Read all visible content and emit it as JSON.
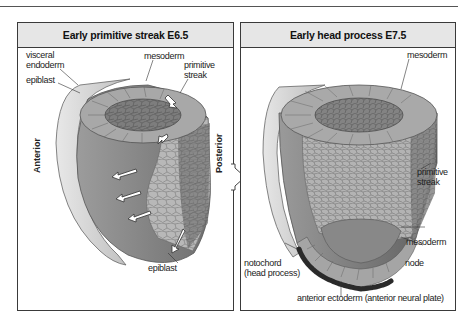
{
  "figure": {
    "panels": [
      {
        "title": "Early primitive streak E6.5",
        "labels": {
          "visceral_endoderm": "visceral\nendoderm",
          "visceral_endoderm_line1": "visceral",
          "visceral_endoderm_line2": "endoderm",
          "epiblast_top": "epiblast",
          "mesoderm": "mesoderm",
          "primitive_streak_line1": "primitive",
          "primitive_streak_line2": "streak",
          "anterior": "Anterior",
          "posterior": "Posterior",
          "epiblast_bottom": "epiblast"
        }
      },
      {
        "title": "Early head process E7.5",
        "labels": {
          "mesoderm_top": "mesoderm",
          "primitive_streak_line1": "primitive",
          "primitive_streak_line2": "streak",
          "mesoderm_bottom": "mesoderm",
          "node": "node",
          "notochord_line1": "notochord",
          "notochord_line2": "(head process)",
          "anterior_ectoderm": "anterior ectoderm (anterior neural plate)"
        }
      }
    ],
    "transition_arrow": "right-chevron-arrow",
    "colors": {
      "header_bg": "#e6e6e6",
      "border": "#3a3a3a",
      "epiblast": "#8a8a8a",
      "mesoderm": "#b5b5b5",
      "visceral_endoderm": "#d9d9d9",
      "cells_dark": "#6e6e6e",
      "notochord": "#2a2a2a",
      "arrow_fill": "#ffffff"
    }
  }
}
